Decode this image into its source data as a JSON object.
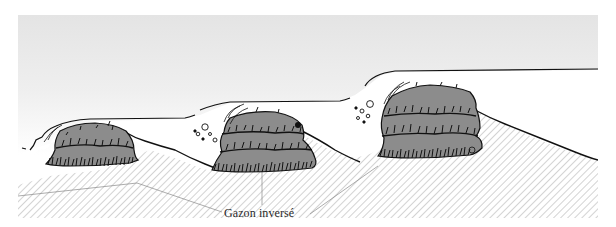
{
  "diagram": {
    "type": "cross-section illustration",
    "label": "Gazon inversé",
    "mounds": [
      {
        "id": 1,
        "position": "left",
        "layers": 2
      },
      {
        "id": 2,
        "position": "center",
        "layers": 3
      },
      {
        "id": 3,
        "position": "right",
        "layers": 3
      }
    ],
    "colors": {
      "sky_top": "#e6e6e6",
      "sky_bottom": "#ffffff",
      "soil_hatch": "#9a9a9a",
      "turf_fill": "#8c8c8c",
      "outline": "#111111",
      "leader_line": "#8a8a8a",
      "label_text": "#2a2a2a"
    }
  }
}
